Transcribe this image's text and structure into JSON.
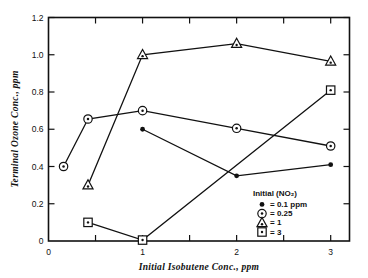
{
  "chart_data": {
    "type": "line",
    "title": "",
    "xlabel": "Initial  Isobutene Conc., ppm",
    "ylabel": "Terminal  Ozone Conc., ppm",
    "xlim": [
      0,
      3.2
    ],
    "ylim": [
      0,
      1.2
    ],
    "xticks": [
      0,
      0.5,
      1,
      1.5,
      2,
      2.5,
      3
    ],
    "xtick_labels": [
      "0",
      "",
      "1",
      "",
      "2",
      "",
      "3"
    ],
    "yticks": [
      0,
      0.2,
      0.4,
      0.6,
      0.8,
      1.0,
      1.2
    ],
    "ytick_labels": [
      "0",
      "0.2",
      "0.4",
      "0.6",
      "0.8",
      "1.0",
      "1.2"
    ],
    "grid": false,
    "legend_position": "inside-lower-right",
    "legend_title": "Initial (NO₂)",
    "series": [
      {
        "name": "0.1 ppm",
        "marker": "filled-circle",
        "legend_label": "= 0.1 ppm",
        "x": [
          1.0,
          2.0,
          3.0
        ],
        "y": [
          0.6,
          0.35,
          0.41
        ]
      },
      {
        "name": "0.25",
        "marker": "circle-dot",
        "legend_label": "= 0.25",
        "x": [
          0.16,
          0.42,
          1.0,
          2.0,
          3.0
        ],
        "y": [
          0.4,
          0.655,
          0.7,
          0.605,
          0.51
        ]
      },
      {
        "name": "1",
        "marker": "triangle-dot",
        "legend_label": "= 1",
        "x": [
          0.42,
          1.0,
          2.0,
          3.0
        ],
        "y": [
          0.3,
          1.0,
          1.06,
          0.965
        ]
      },
      {
        "name": "3",
        "marker": "square-dot",
        "legend_label": "= 3",
        "x": [
          0.42,
          1.0,
          3.0
        ],
        "y": [
          0.1,
          0.005,
          0.81
        ]
      }
    ]
  },
  "axes": {
    "x_label": "Initial  Isobutene Conc., ppm",
    "y_label": "Terminal  Ozone Conc., ppm",
    "x_tick_labels": [
      "0",
      "1",
      "2",
      "3"
    ],
    "y_tick_labels": [
      "0",
      "0.2",
      "0.4",
      "0.6",
      "0.8",
      "1.0",
      "1.2"
    ]
  },
  "legend": {
    "title": "Initial (NO₂)",
    "entries": [
      {
        "marker": "filled-circle",
        "label": "= 0.1 ppm"
      },
      {
        "marker": "circle-dot",
        "label": "= 0.25"
      },
      {
        "marker": "triangle-dot",
        "label": "= 1"
      },
      {
        "marker": "square-dot",
        "label": "= 3"
      }
    ]
  },
  "colors": {
    "ink": "#111111",
    "background": "#ffffff"
  }
}
